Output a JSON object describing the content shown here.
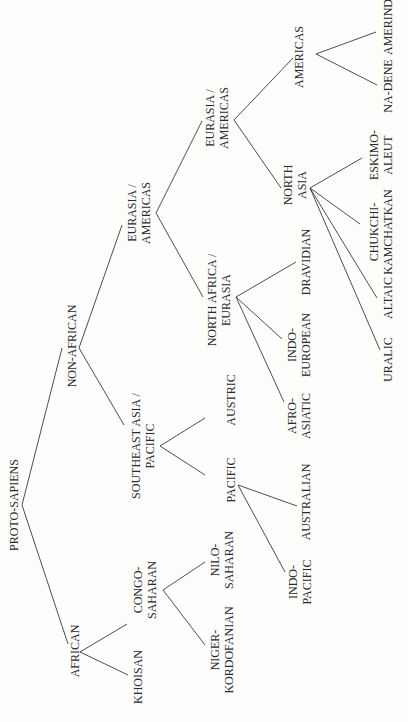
{
  "diagram": {
    "nodes": {
      "root": {
        "lines": [
          "PROTO-SAPIENS"
        ]
      },
      "african": {
        "lines": [
          "AFRICAN"
        ]
      },
      "khoisan": {
        "lines": [
          "KHOISAN"
        ]
      },
      "congo_saharan": {
        "lines": [
          "CONGO-",
          "SAHARAN"
        ]
      },
      "niger_kordofanian": {
        "lines": [
          "NIGER-",
          "KORDOFANIAN"
        ]
      },
      "nilo_saharan": {
        "lines": [
          "NILO-",
          "SAHARAN"
        ]
      },
      "non_african": {
        "lines": [
          "NON-AFRICAN"
        ]
      },
      "se_asia_pacific": {
        "lines": [
          "SOUTHEAST ASIA /",
          "PACIFIC"
        ]
      },
      "pacific": {
        "lines": [
          "PACIFIC"
        ]
      },
      "austric": {
        "lines": [
          "AUSTRIC"
        ]
      },
      "indo_pacific": {
        "lines": [
          "INDO-",
          "PACIFIC"
        ]
      },
      "australian": {
        "lines": [
          "AUSTRALIAN"
        ]
      },
      "eurasia_americas_1": {
        "lines": [
          "EURASIA /",
          "AMERICAS"
        ]
      },
      "north_africa_eurasia": {
        "lines": [
          "NORTH AFRICA /",
          "EURASIA"
        ]
      },
      "afro_asiatic": {
        "lines": [
          "AFRO-",
          "ASIATIC"
        ]
      },
      "indo_european": {
        "lines": [
          "INDO-",
          "EUROPEAN"
        ]
      },
      "dravidian": {
        "lines": [
          "DRAVIDIAN"
        ]
      },
      "eurasia_americas_2": {
        "lines": [
          "EURASIA /",
          "AMERICAS"
        ]
      },
      "north_asia": {
        "lines": [
          "NORTH",
          "ASIA"
        ]
      },
      "uralic": {
        "lines": [
          "URALIC"
        ]
      },
      "altaic": {
        "lines": [
          "ALTAIC"
        ]
      },
      "chukchi_kamchatkan": {
        "lines": [
          "CHUKCHI-",
          "KAMCHATKAN"
        ]
      },
      "eskimo_aleut": {
        "lines": [
          "ESKIMO-",
          "ALEUT"
        ]
      },
      "americas": {
        "lines": [
          "AMERICAS"
        ]
      },
      "na_dene": {
        "lines": [
          "NA-DENE"
        ]
      },
      "amerind": {
        "lines": [
          "AMERIND"
        ]
      }
    },
    "edges": [
      [
        "root",
        "african"
      ],
      [
        "root",
        "non_african"
      ],
      [
        "african",
        "khoisan"
      ],
      [
        "african",
        "congo_saharan"
      ],
      [
        "congo_saharan",
        "niger_kordofanian"
      ],
      [
        "congo_saharan",
        "nilo_saharan"
      ],
      [
        "non_african",
        "se_asia_pacific"
      ],
      [
        "non_african",
        "eurasia_americas_1"
      ],
      [
        "se_asia_pacific",
        "pacific"
      ],
      [
        "se_asia_pacific",
        "austric"
      ],
      [
        "pacific",
        "indo_pacific"
      ],
      [
        "pacific",
        "australian"
      ],
      [
        "eurasia_americas_1",
        "north_africa_eurasia"
      ],
      [
        "eurasia_americas_1",
        "eurasia_americas_2"
      ],
      [
        "north_africa_eurasia",
        "afro_asiatic"
      ],
      [
        "north_africa_eurasia",
        "indo_european"
      ],
      [
        "north_africa_eurasia",
        "dravidian"
      ],
      [
        "eurasia_americas_2",
        "north_asia"
      ],
      [
        "eurasia_americas_2",
        "americas"
      ],
      [
        "north_asia",
        "uralic"
      ],
      [
        "north_asia",
        "altaic"
      ],
      [
        "north_asia",
        "chukchi_kamchatkan"
      ],
      [
        "north_asia",
        "eskimo_aleut"
      ],
      [
        "americas",
        "na_dene"
      ],
      [
        "americas",
        "amerind"
      ]
    ]
  }
}
